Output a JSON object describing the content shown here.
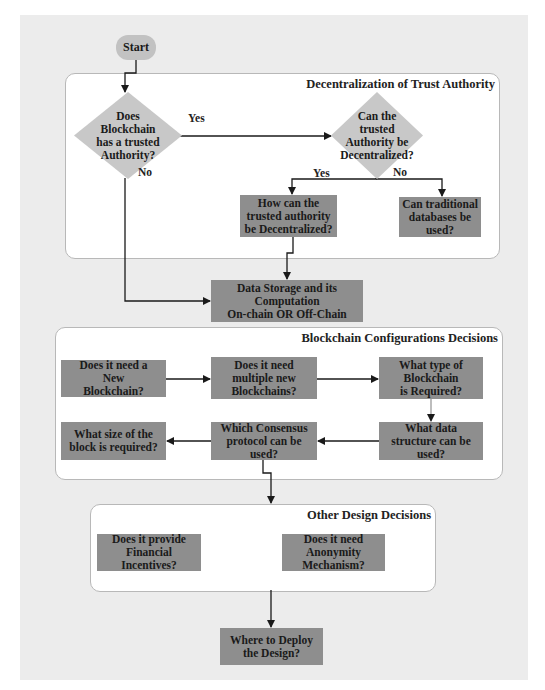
{
  "start": {
    "label": "Start"
  },
  "panels": {
    "trust": {
      "title": "Decentralization of Trust Authority"
    },
    "config": {
      "title": "Blockchain Configurations Decisions"
    },
    "other": {
      "title": "Other Design Decisions"
    }
  },
  "decisions": {
    "trusted_authority": "Does Blockchain has a trusted Authority?",
    "can_decentralize": "Can the trusted Authority be Decentralized?"
  },
  "edge_labels": {
    "d1_yes": "Yes",
    "d1_no": "No",
    "d2_yes": "Yes",
    "d2_no": "No"
  },
  "boxes": {
    "how_decentralize": "How can the trusted authority be Decentralized?",
    "traditional_db": "Can traditional databases be used?",
    "data_storage_l1": "Data Storage and its",
    "data_storage_l2": "Computation",
    "data_storage_l3": "On-chain OR Off-Chain",
    "new_blockchain": "Does it need a New Blockchain?",
    "multiple_blockchains": "Does it need multiple new Blockchains?",
    "blockchain_type": "What type of Blockchain is Required?",
    "data_structure": "What data structure can be used?",
    "consensus": "Which Consensus protocol can be used?",
    "block_size": "What size of the block is required?",
    "financial_incentives": "Does it provide Financial Incentives?",
    "anonymity": "Does it need Anonymity Mechanism?",
    "deploy": "Where to Deploy the Design?"
  },
  "colors": {
    "process_box": "#8e8e8e",
    "decision_fill": "#c8c8c8",
    "terminal_fill": "#c2c2c2",
    "panel_bg": "#ffffff",
    "page_bg": "#ececec",
    "line": "#1a1a1a"
  }
}
